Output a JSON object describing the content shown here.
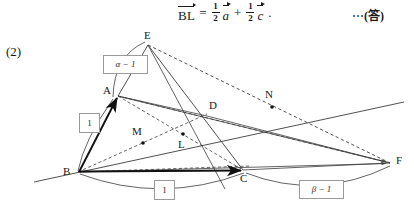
{
  "formula": {
    "lhs": "BL",
    "equals": "=",
    "term1": {
      "num": "1",
      "den": "2",
      "vector": "a"
    },
    "plus": "+",
    "term2": {
      "num": "1",
      "den": "2",
      "vector": "c"
    },
    "period": ".",
    "answer_tag_dots": "⋯",
    "answer_tag_text": "(答)"
  },
  "problem": {
    "number": "(2)"
  },
  "figure": {
    "points": [
      {
        "id": "E",
        "label": "E",
        "x": 148,
        "y": 45,
        "label_x": 144,
        "label_y": 30,
        "dot": false
      },
      {
        "id": "A",
        "label": "A",
        "x": 118,
        "y": 96,
        "label_x": 103,
        "label_y": 86,
        "dot": false
      },
      {
        "id": "B",
        "label": "B",
        "x": 78,
        "y": 172,
        "label_x": 64,
        "label_y": 168,
        "dot": false
      },
      {
        "id": "C",
        "label": "C",
        "x": 243,
        "y": 170,
        "label_x": 242,
        "label_y": 173,
        "dot": false
      },
      {
        "id": "D",
        "label": "D",
        "x": 204,
        "y": 116,
        "label_x": 210,
        "label_y": 101,
        "dot": false
      },
      {
        "id": "F",
        "label": "F",
        "x": 390,
        "y": 163,
        "label_x": 396,
        "label_y": 156,
        "dot": false
      },
      {
        "id": "M",
        "label": "M",
        "x": 143,
        "y": 143,
        "label_x": 133,
        "label_y": 126,
        "dot": true
      },
      {
        "id": "L",
        "label": "L",
        "x": 183,
        "y": 134,
        "label_x": 179,
        "label_y": 139,
        "dot": true
      },
      {
        "id": "N",
        "label": "N",
        "x": 272,
        "y": 107,
        "label_x": 266,
        "label_y": 89,
        "dot": true
      }
    ],
    "tags": [
      {
        "id": "alpha-minus-one",
        "text": "α − 1",
        "x": 103,
        "y": 55,
        "w": 37,
        "h": 13,
        "italic_first": true
      },
      {
        "id": "ab-length",
        "text": "1",
        "x": 79,
        "y": 113,
        "w": 13,
        "h": 14,
        "italic_first": false
      },
      {
        "id": "bc-length",
        "text": "1",
        "x": 154,
        "y": 180,
        "w": 13,
        "h": 14,
        "italic_first": false
      },
      {
        "id": "beta-minus-one",
        "text": "β − 1",
        "x": 299,
        "y": 180,
        "w": 37,
        "h": 13,
        "italic_first": true
      }
    ],
    "colors": {
      "stroke": "#3c3c3c",
      "thick_stroke": "#111111",
      "tag_border": "#9a9a9a",
      "background": "#ffffff"
    },
    "vectors": [
      {
        "from": "B",
        "to": "A",
        "style": "thick-arrow"
      },
      {
        "from": "B",
        "to": "C",
        "style": "thick-arrow"
      },
      {
        "from": "B",
        "to": "F",
        "style": "thin-arrow"
      },
      {
        "from": "A",
        "to": "F",
        "style": "thin-arrow"
      }
    ]
  }
}
